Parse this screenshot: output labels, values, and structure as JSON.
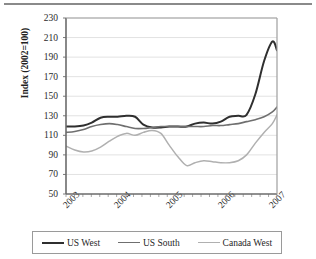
{
  "chart_data": {
    "type": "line",
    "title": "",
    "subtitle": "",
    "xlabel": "",
    "ylabel": "Index (2002=100)",
    "ylim": [
      50,
      230
    ],
    "ytick_labels": [
      "230",
      "210",
      "190",
      "170",
      "150",
      "130",
      "110",
      "90",
      "70",
      "50"
    ],
    "ytick_values": [
      230,
      210,
      190,
      170,
      150,
      130,
      110,
      90,
      70,
      50
    ],
    "xtick_labels": [
      "2003",
      "2004",
      "2005",
      "2006",
      "2007"
    ],
    "xtick_values": [
      2003,
      2004,
      2005,
      2006,
      2007
    ],
    "xlim": [
      2002.83,
      2006.92
    ],
    "grid": "horizontal",
    "legend_position": "bottom",
    "series": [
      {
        "name": "US West",
        "color": "#2f2f2f",
        "width": 2.0,
        "x": [
          2002.83,
          2003.0,
          2003.17,
          2003.33,
          2003.5,
          2003.67,
          2003.83,
          2004.0,
          2004.17,
          2004.33,
          2004.5,
          2004.67,
          2004.83,
          2005.0,
          2005.17,
          2005.33,
          2005.5,
          2005.67,
          2005.83,
          2006.0,
          2006.17,
          2006.33,
          2006.5,
          2006.67,
          2006.83,
          2006.92
        ],
        "values": [
          119,
          119,
          120,
          123,
          128,
          129,
          129,
          130,
          129,
          121,
          118,
          118,
          119,
          119,
          119,
          122,
          123,
          122,
          124,
          129,
          130,
          131,
          152,
          186,
          206,
          197
        ]
      },
      {
        "name": "US South",
        "color": "#6f6f6f",
        "width": 1.6,
        "x": [
          2002.83,
          2003.0,
          2003.17,
          2003.33,
          2003.5,
          2003.67,
          2003.83,
          2004.0,
          2004.17,
          2004.33,
          2004.5,
          2004.67,
          2004.83,
          2005.0,
          2005.17,
          2005.33,
          2005.5,
          2005.67,
          2005.83,
          2006.0,
          2006.17,
          2006.33,
          2006.5,
          2006.67,
          2006.83,
          2006.92
        ],
        "values": [
          113,
          114,
          116,
          119,
          121,
          122,
          121,
          119,
          117,
          117,
          118,
          119,
          119,
          119,
          119,
          119,
          119,
          120,
          120,
          121,
          122,
          124,
          126,
          129,
          134,
          139
        ]
      },
      {
        "name": "Canada West",
        "color": "#b0b0b0",
        "width": 1.5,
        "x": [
          2002.83,
          2003.0,
          2003.17,
          2003.33,
          2003.5,
          2003.67,
          2003.83,
          2004.0,
          2004.17,
          2004.33,
          2004.5,
          2004.67,
          2004.83,
          2005.0,
          2005.17,
          2005.33,
          2005.5,
          2005.67,
          2005.83,
          2006.0,
          2006.17,
          2006.33,
          2006.5,
          2006.67,
          2006.83,
          2006.92
        ],
        "values": [
          99,
          95,
          93,
          94,
          98,
          104,
          109,
          112,
          110,
          113,
          115,
          112,
          100,
          88,
          79,
          82,
          84,
          83,
          82,
          82,
          84,
          90,
          102,
          113,
          122,
          131
        ]
      }
    ]
  },
  "legend": {
    "items": [
      {
        "label": "US West"
      },
      {
        "label": "US South"
      },
      {
        "label": "Canada West"
      }
    ]
  }
}
